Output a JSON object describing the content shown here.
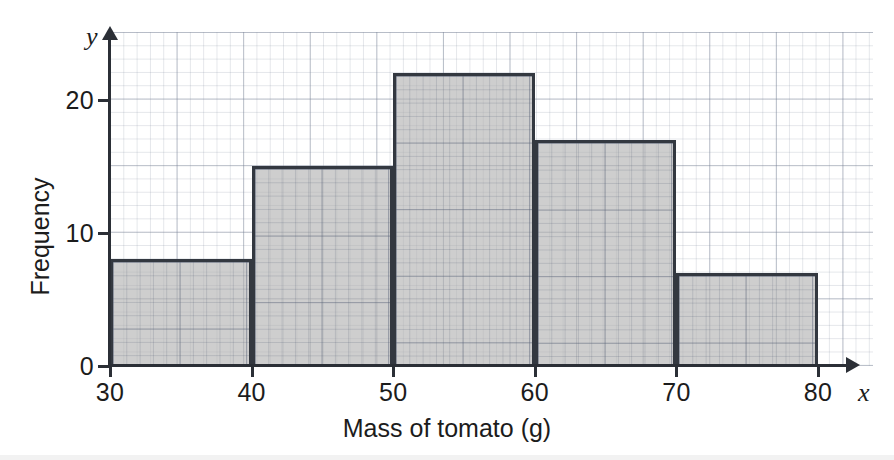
{
  "chart_data": {
    "type": "bar",
    "title": "",
    "subtitle": "",
    "xlabel": "Mass of tomato (g)",
    "ylabel": "Frequency",
    "x_axis_letter": "x",
    "y_axis_letter": "y",
    "categories": [
      "30-40",
      "40-50",
      "50-60",
      "60-70",
      "70-80"
    ],
    "bin_edges": [
      30,
      40,
      50,
      60,
      70,
      80
    ],
    "values": [
      8,
      15,
      22,
      17,
      7
    ],
    "xlim": [
      30,
      80
    ],
    "ylim": [
      0,
      25
    ],
    "x_tick_labels": [
      "30",
      "40",
      "50",
      "60",
      "70",
      "80"
    ],
    "y_tick_labels": [
      "0",
      "10",
      "20"
    ],
    "y_tick_values": [
      0,
      10,
      20
    ],
    "grid": true,
    "grid_minor": true,
    "legend": false,
    "legend_position": "none",
    "annotations": [],
    "colors": {
      "bar_fill": "#b0b0b0",
      "bar_outline": "#333840",
      "axis": "#2b2f36",
      "grid_major": "#7882 96",
      "text": "#1c1c1c",
      "background": "#ffffff"
    }
  },
  "bars": [
    {
      "label": "30-40",
      "from": 30,
      "to": 40,
      "value": 8
    },
    {
      "label": "40-50",
      "from": 40,
      "to": 50,
      "value": 15
    },
    {
      "label": "50-60",
      "from": 50,
      "to": 60,
      "value": 22
    },
    {
      "label": "60-70",
      "from": 60,
      "to": 70,
      "value": 17
    },
    {
      "label": "70-80",
      "from": 70,
      "to": 80,
      "value": 7
    }
  ]
}
